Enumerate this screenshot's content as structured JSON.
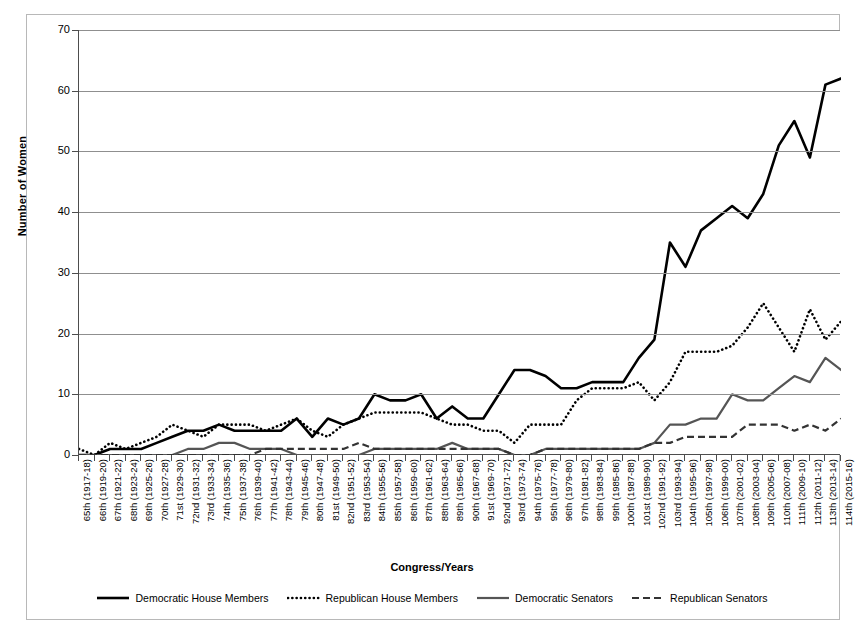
{
  "chart_data": {
    "type": "line",
    "title": "",
    "xlabel": "Congress/Years",
    "ylabel": "Number of Women",
    "ylim": [
      0,
      70
    ],
    "yticks": [
      0,
      10,
      20,
      30,
      40,
      50,
      60,
      70
    ],
    "grid": true,
    "legend_position": "bottom",
    "categories": [
      "65th (1917-18)",
      "66th (1919-20)",
      "67th (1921-22)",
      "68th (1923-24)",
      "69th (1925-26)",
      "70th (1927-28)",
      "71st (1929-30)",
      "72nd (1931-32)",
      "73rd (1933-34)",
      "74th (1935-36)",
      "75th (1937-38)",
      "76th (1939-40)",
      "77th (1941-42)",
      "78th (1943-44)",
      "79th (1945-46)",
      "80th (1947-48)",
      "81st (1949-50)",
      "82nd (1951-52)",
      "83rd (1953-54)",
      "84th (1955-56)",
      "85th (1957-58)",
      "86th (1959-60)",
      "87th (1961-62)",
      "88th (1963-64)",
      "89th (1965-66)",
      "90th (1967-68)",
      "91st (1969-70)",
      "92nd (1971-72)",
      "93rd (1973-74)",
      "94th (1975-76)",
      "95th (1977-78)",
      "96th (1979-80)",
      "97th (1981-82)",
      "98th (1983-84)",
      "99th (1985-86)",
      "100th (1987-88)",
      "101st (1989-90)",
      "102nd (1991-92)",
      "103rd (1993-94)",
      "104th (1995-96)",
      "105th (1997-98)",
      "106th (1999-00)",
      "107th (2001-02)",
      "108th (2003-04)",
      "109th (2005-06)",
      "110th (2007-08)",
      "111th (2009-10)",
      "112th (2011-12)",
      "113th (2013-14)",
      "114th (2015-16)"
    ],
    "series": [
      {
        "name": "Democratic House Members",
        "style": "solid",
        "color": "#000000",
        "width": 2.6,
        "values": [
          0,
          0,
          1,
          1,
          1,
          2,
          3,
          4,
          4,
          5,
          4,
          4,
          4,
          4,
          6,
          3,
          6,
          5,
          6,
          10,
          9,
          9,
          10,
          6,
          8,
          6,
          6,
          10,
          14,
          14,
          13,
          11,
          11,
          12,
          12,
          12,
          16,
          19,
          35,
          31,
          37,
          39,
          41,
          39,
          43,
          51,
          55,
          49,
          61,
          62
        ]
      },
      {
        "name": "Republican House Members",
        "style": "dotted",
        "color": "#000000",
        "width": 2.6,
        "values": [
          1,
          0,
          2,
          1,
          2,
          3,
          5,
          4,
          3,
          5,
          5,
          5,
          4,
          5,
          6,
          4,
          3,
          5,
          6,
          7,
          7,
          7,
          7,
          6,
          5,
          5,
          4,
          4,
          2,
          5,
          5,
          5,
          9,
          11,
          11,
          11,
          12,
          9,
          12,
          17,
          17,
          17,
          18,
          21,
          25,
          21,
          17,
          24,
          19,
          22
        ]
      },
      {
        "name": "Democratic Senators",
        "style": "solid",
        "color": "#555555",
        "width": 2.2,
        "values": [
          0,
          0,
          0,
          0,
          0,
          0,
          0,
          1,
          1,
          2,
          2,
          1,
          1,
          1,
          0,
          0,
          0,
          0,
          0,
          1,
          1,
          1,
          1,
          1,
          2,
          1,
          1,
          1,
          0,
          0,
          1,
          1,
          1,
          1,
          1,
          1,
          1,
          2,
          5,
          5,
          6,
          6,
          10,
          9,
          9,
          11,
          13,
          12,
          16,
          14
        ]
      },
      {
        "name": "Republican Senators",
        "style": "dashed",
        "color": "#333333",
        "width": 2.2,
        "values": [
          0,
          0,
          0,
          0,
          0,
          0,
          0,
          0,
          0,
          0,
          0,
          0,
          1,
          1,
          1,
          1,
          1,
          1,
          2,
          1,
          1,
          1,
          1,
          1,
          1,
          1,
          1,
          1,
          0,
          0,
          1,
          1,
          1,
          1,
          1,
          1,
          1,
          2,
          2,
          3,
          3,
          3,
          3,
          5,
          5,
          5,
          4,
          5,
          4,
          6
        ]
      }
    ]
  },
  "legend": {
    "items": [
      {
        "label": "Democratic House Members",
        "icon": "solid-thick-line-icon"
      },
      {
        "label": "Republican House Members",
        "icon": "dotted-line-icon"
      },
      {
        "label": "Democratic Senators",
        "icon": "solid-line-icon"
      },
      {
        "label": "Republican Senators",
        "icon": "dashed-line-icon"
      }
    ]
  }
}
